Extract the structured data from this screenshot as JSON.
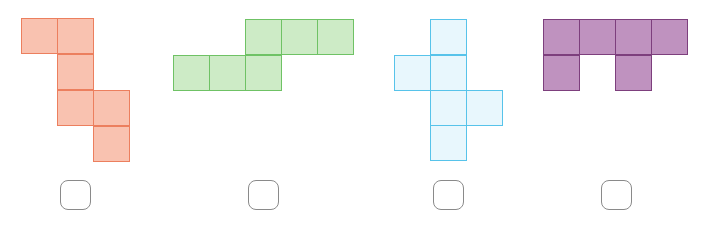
{
  "colors": {
    "orange": {
      "fill": "#f9c2b0",
      "stroke": "#ec7f5e"
    },
    "green": {
      "fill": "#cdebc6",
      "stroke": "#6fc265"
    },
    "blue": {
      "fill": "#e8f7fd",
      "stroke": "#57c3ea"
    },
    "purple": {
      "fill": "#bf92bf",
      "stroke": "#7d3f7d"
    }
  },
  "shapes": [
    {
      "name": "orange-net",
      "color": "orange",
      "squares": [
        [
          21,
          18
        ],
        [
          57,
          18
        ],
        [
          57,
          54
        ],
        [
          57,
          90
        ],
        [
          93,
          90
        ],
        [
          93,
          126
        ]
      ],
      "answer_box": [
        60,
        180
      ]
    },
    {
      "name": "green-net",
      "color": "green",
      "squares": [
        [
          245,
          19
        ],
        [
          281,
          19
        ],
        [
          317,
          19
        ],
        [
          173,
          55
        ],
        [
          209,
          55
        ],
        [
          245,
          55
        ]
      ],
      "answer_box": [
        248,
        180
      ]
    },
    {
      "name": "blue-net",
      "color": "blue",
      "squares": [
        [
          430,
          19
        ],
        [
          394,
          55
        ],
        [
          430,
          55
        ],
        [
          430,
          90
        ],
        [
          466,
          90
        ],
        [
          430,
          125
        ]
      ],
      "answer_box": [
        433,
        180
      ]
    },
    {
      "name": "purple-net",
      "color": "purple",
      "squares": [
        [
          543,
          19
        ],
        [
          579,
          19
        ],
        [
          615,
          19
        ],
        [
          651,
          19
        ],
        [
          543,
          55
        ],
        [
          615,
          55
        ]
      ],
      "answer_box": [
        601,
        180
      ]
    }
  ]
}
